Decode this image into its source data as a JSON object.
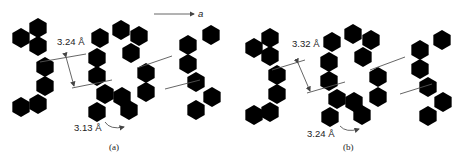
{
  "figure": {
    "panels": [
      {
        "id": "a",
        "caption": "(a)",
        "interlayer_distance_label": "3.24 Å",
        "short_contact_label": "3.13 Å"
      },
      {
        "id": "b",
        "caption": "(b)",
        "interlayer_distance_label": "3.32 Å",
        "short_contact_label": "3.24 Å"
      }
    ],
    "axis_arrow_label": "a",
    "colors": {
      "bonds": "#7a7a7a",
      "lines": "#555555",
      "text": "#222222"
    }
  }
}
